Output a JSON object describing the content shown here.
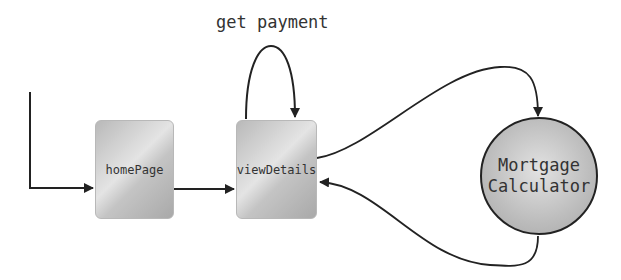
{
  "diagram": {
    "nodes": [
      {
        "id": "homePage",
        "label": "homePage",
        "shape": "rounded-rect"
      },
      {
        "id": "viewDetails",
        "label": "viewDetails",
        "shape": "rounded-rect"
      },
      {
        "id": "mortgage",
        "label_line1": "Mortgage",
        "label_line2": "Calculator",
        "shape": "circle"
      }
    ],
    "edges": [
      {
        "from": "start",
        "to": "homePage"
      },
      {
        "from": "homePage",
        "to": "viewDetails"
      },
      {
        "from": "viewDetails",
        "to": "viewDetails",
        "label": "get payment"
      },
      {
        "from": "viewDetails",
        "to": "mortgage"
      },
      {
        "from": "mortgage",
        "to": "viewDetails"
      }
    ],
    "self_loop_label": "get payment"
  }
}
